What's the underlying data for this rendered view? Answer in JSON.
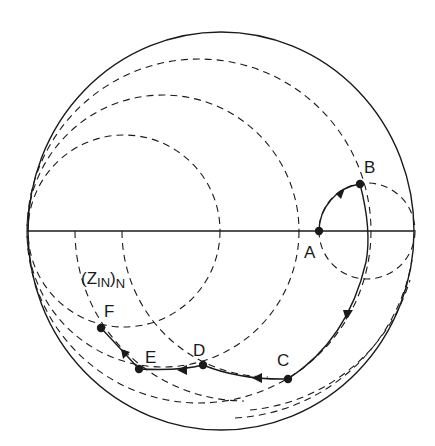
{
  "diagram": {
    "type": "smith-chart",
    "colors": {
      "background": "#ffffff",
      "ink": "#1a1a1a"
    },
    "outer_circle": {
      "cx": 221,
      "cy": 231,
      "rx": 193,
      "ry": 199
    },
    "real_axis": {
      "x1": 28,
      "x2": 414,
      "y": 231
    },
    "resistance_circles_dashed": [
      {
        "cx": 124,
        "cy": 231,
        "r": 96
      },
      {
        "cx": 163,
        "cy": 231,
        "r": 136
      },
      {
        "cx": 199,
        "cy": 231,
        "r": 172
      }
    ],
    "small_circle_dashed": {
      "cx": 367,
      "cy": 231,
      "r": 48
    },
    "admittance_circles_dashed": [
      {
        "cx": 244,
        "cy": 231,
        "r": 170
      },
      {
        "cx": 268,
        "cy": 231,
        "r": 146
      }
    ],
    "points": [
      {
        "id": "A",
        "label": "A",
        "x": 319,
        "y": 231,
        "label_x": 302,
        "label_y": 258
      },
      {
        "id": "B",
        "label": "B",
        "x": 360,
        "y": 184,
        "label_x": 364,
        "label_y": 173
      },
      {
        "id": "C",
        "label": "C",
        "x": 288,
        "y": 379,
        "label_x": 277,
        "label_y": 365
      },
      {
        "id": "D",
        "label": "D",
        "x": 203,
        "y": 365,
        "label_x": 193,
        "label_y": 355
      },
      {
        "id": "E",
        "label": "E",
        "x": 139,
        "y": 369,
        "label_x": 145,
        "label_y": 362
      },
      {
        "id": "F",
        "label": "F",
        "x": 101,
        "y": 328,
        "label_x": 104,
        "label_y": 317
      }
    ],
    "path_segments": [
      {
        "from": "A",
        "to": "B",
        "description": "constant-resistance arc A to B"
      },
      {
        "from": "B",
        "to": "C",
        "description": "constant-conductance arc B to C"
      },
      {
        "from": "C",
        "to": "D",
        "description": "arc C to D"
      },
      {
        "from": "D",
        "to": "E",
        "description": "arc D to E"
      },
      {
        "from": "E",
        "to": "F",
        "description": "arc E to F"
      }
    ],
    "impedance_label": {
      "open_paren": "(",
      "z": "Z",
      "sub_in": "IN",
      "close_paren": ")",
      "sub_n": "N"
    }
  }
}
